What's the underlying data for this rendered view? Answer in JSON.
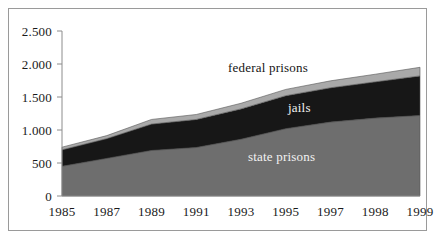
{
  "figure": {
    "background_color": "#ffffff",
    "frame_color": "#9a9a9a"
  },
  "axis": {
    "y_ticks": [
      "2.500",
      "2.000",
      "1.500",
      "1.000",
      "500",
      "0"
    ],
    "y_tick_values": [
      2500,
      2000,
      1500,
      1000,
      500,
      0
    ],
    "x_ticks": [
      "1985",
      "1987",
      "1989",
      "1991",
      "1993",
      "1995",
      "1997",
      "1998",
      "1999"
    ],
    "axis_line_color": "#8c8c8c"
  },
  "labels": {
    "federal_prisons": "federal prisons",
    "jails": "jails",
    "state_prisons": "state prisons"
  },
  "colors": {
    "state_prisons": "#6e6e6e",
    "jails": "#171717",
    "federal_prisons": "#a9a9a9",
    "outline": "#555555"
  },
  "chart_data": {
    "type": "area",
    "stacked": true,
    "title": "",
    "subtitle": "",
    "xlabel": "",
    "ylabel": "",
    "ylim": [
      0,
      2500
    ],
    "grid": false,
    "legend_position": "inline-annotations",
    "categories": [
      "1985",
      "1987",
      "1989",
      "1991",
      "1993",
      "1995",
      "1997",
      "1998",
      "1999"
    ],
    "x": [
      1985,
      1987,
      1989,
      1991,
      1993,
      1995,
      1997,
      1998,
      1999
    ],
    "units": "thousands of inmates",
    "series": [
      {
        "name": "state prisons",
        "color": "#6e6e6e",
        "values": [
          450,
          570,
          690,
          735,
          860,
          1020,
          1120,
          1180,
          1220
        ]
      },
      {
        "name": "jails",
        "color": "#171717",
        "values": [
          250,
          300,
          400,
          425,
          460,
          500,
          520,
          550,
          600
        ]
      },
      {
        "name": "federal prisons",
        "color": "#a9a9a9",
        "values": [
          40,
          45,
          70,
          75,
          85,
          95,
          105,
          115,
          130
        ]
      }
    ],
    "cumulative_totals": [
      740,
      915,
      1160,
      1235,
      1405,
      1615,
      1745,
      1845,
      1950
    ],
    "annotations": [
      {
        "text": "federal prisons",
        "series": "federal prisons"
      },
      {
        "text": "jails",
        "series": "jails"
      },
      {
        "text": "state prisons",
        "series": "state prisons"
      }
    ]
  }
}
